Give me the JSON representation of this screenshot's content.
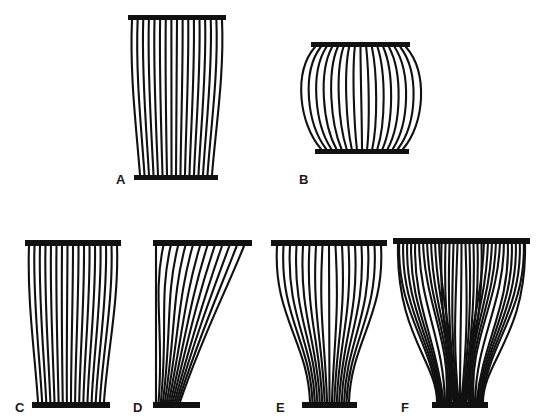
{
  "figure": {
    "panels": [
      {
        "id": "A",
        "label": "A",
        "type": "fusiform-parallel",
        "top_bar": {
          "x": 128,
          "y": 15,
          "w": 98,
          "h": 5
        },
        "bottom_bar": {
          "x": 134,
          "y": 175,
          "w": 84,
          "h": 5
        },
        "label_pos": {
          "x": 116,
          "y": 184
        },
        "fibers": 17,
        "bulge": 6
      },
      {
        "id": "B",
        "label": "B",
        "type": "convergent-bulging",
        "top_bar": {
          "x": 311,
          "y": 42,
          "w": 99,
          "h": 5
        },
        "bottom_bar": {
          "x": 315,
          "y": 149,
          "w": 94,
          "h": 5
        },
        "label_pos": {
          "x": 299,
          "y": 184
        },
        "fibers": 17,
        "bulge": 20
      },
      {
        "id": "C",
        "label": "C",
        "type": "parallel-strap",
        "top_bar": {
          "x": 25,
          "y": 240,
          "w": 96,
          "h": 6
        },
        "bottom_bar": {
          "x": 32,
          "y": 402,
          "w": 78,
          "h": 6
        },
        "label_pos": {
          "x": 15,
          "y": 412
        },
        "fibers": 17,
        "bulge": 5
      },
      {
        "id": "D",
        "label": "D",
        "type": "unipennate",
        "top_bar": {
          "x": 153,
          "y": 240,
          "w": 99,
          "h": 6
        },
        "bottom_bar": {
          "x": 153,
          "y": 402,
          "w": 47,
          "h": 6
        },
        "label_pos": {
          "x": 133,
          "y": 412
        },
        "fibers": 13
      },
      {
        "id": "E",
        "label": "E",
        "type": "bipennate",
        "top_bar": {
          "x": 271,
          "y": 240,
          "w": 116,
          "h": 6
        },
        "bottom_bar": {
          "x": 302,
          "y": 402,
          "w": 55,
          "h": 6
        },
        "label_pos": {
          "x": 276,
          "y": 412
        },
        "fibers": 8
      },
      {
        "id": "F",
        "label": "F",
        "type": "multipennate",
        "top_bar": {
          "x": 393,
          "y": 238,
          "w": 137,
          "h": 6
        },
        "bottom_bar": {
          "x": 432,
          "y": 402,
          "w": 56,
          "h": 6
        },
        "label_pos": {
          "x": 401,
          "y": 412
        },
        "sections": 3,
        "fibers_per_side": 5
      }
    ],
    "colors": {
      "ink": "#111111",
      "background": "#ffffff"
    }
  }
}
